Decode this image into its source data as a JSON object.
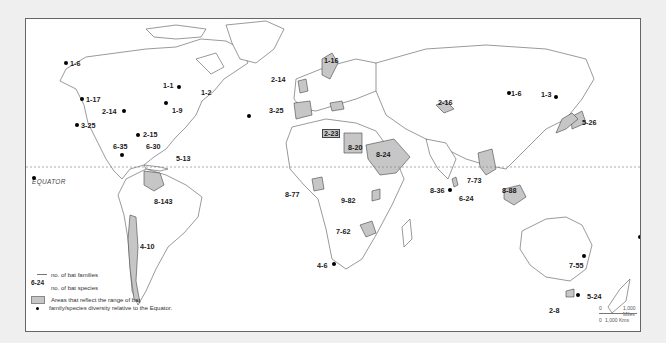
{
  "equator_label": "EQUATOR",
  "legend": {
    "example_value": "6-24",
    "families_label": "no. of bat families",
    "species_label": "no. of bat species",
    "shade_label": "Areas that reflect the range of bat",
    "dot_label": "family/species diversity relative to the Equator."
  },
  "scale": {
    "miles_zero": "0",
    "miles_label": "1,000 Miles",
    "kms_zero": "0",
    "kms_label": "1,000 Kms"
  },
  "colors": {
    "background": "#efefef",
    "map": "#ffffff",
    "shaded_area": "#c6c6c6",
    "dot": "#000000"
  },
  "locations": [
    {
      "label": "1-6",
      "region": "Alaska",
      "type": "dot"
    },
    {
      "label": "1-1",
      "region": "Quebec",
      "type": "dot"
    },
    {
      "label": "1-2",
      "region": "Newfoundland",
      "type": "shade"
    },
    {
      "label": "1-17",
      "region": "Pacific Northwest",
      "type": "dot"
    },
    {
      "label": "1-9",
      "region": "New England",
      "type": "dot"
    },
    {
      "label": "2-14",
      "region": "Central USA",
      "type": "dot"
    },
    {
      "label": "3-25",
      "region": "California",
      "type": "dot"
    },
    {
      "label": "2-15",
      "region": "Florida",
      "type": "dot"
    },
    {
      "label": "6-35",
      "region": "Mexico (Yucatan)",
      "type": "dot"
    },
    {
      "label": "6-30",
      "region": "Cuba",
      "type": "label"
    },
    {
      "label": "5-13",
      "region": "Lesser Antilles",
      "type": "label"
    },
    {
      "label": "8-143",
      "region": "Venezuela",
      "type": "shade"
    },
    {
      "label": "4-10",
      "region": "Chile",
      "type": "shade"
    },
    {
      "label": "1-16",
      "region": "Sweden",
      "type": "shade"
    },
    {
      "label": "2-14",
      "region": "Great Britain",
      "type": "shade"
    },
    {
      "label": "3-25",
      "region": "Spain",
      "type": "shade"
    },
    {
      "label": "2-23",
      "region": "Balkans",
      "type": "shade"
    },
    {
      "label": "8-20",
      "region": "Egypt",
      "type": "shade"
    },
    {
      "label": "8-24",
      "region": "Arabian Peninsula",
      "type": "shade"
    },
    {
      "label": "2-16",
      "region": "Kyrgyzstan",
      "type": "shade"
    },
    {
      "label": "1-6",
      "region": "Mongolia",
      "type": "dot"
    },
    {
      "label": "1-3",
      "region": "Manchuria",
      "type": "dot"
    },
    {
      "label": "5-26",
      "region": "Japan",
      "type": "shade"
    },
    {
      "label": "8-77",
      "region": "Ivory Coast",
      "type": "shade"
    },
    {
      "label": "9-82",
      "region": "Uganda",
      "type": "shade"
    },
    {
      "label": "7-62",
      "region": "Zimbabwe",
      "type": "shade"
    },
    {
      "label": "4-6",
      "region": "South Africa",
      "type": "dot"
    },
    {
      "label": "8-36",
      "region": "India",
      "type": "dot"
    },
    {
      "label": "6-24",
      "region": "Sri Lanka",
      "type": "shade"
    },
    {
      "label": "7-73",
      "region": "Thailand",
      "type": "shade"
    },
    {
      "label": "8-88",
      "region": "Borneo",
      "type": "shade"
    },
    {
      "label": "7-55",
      "region": "Queensland",
      "type": "dot"
    },
    {
      "label": "5-24",
      "region": "New South Wales",
      "type": "dot"
    },
    {
      "label": "2-8",
      "region": "Tasmania",
      "type": "shade"
    }
  ]
}
